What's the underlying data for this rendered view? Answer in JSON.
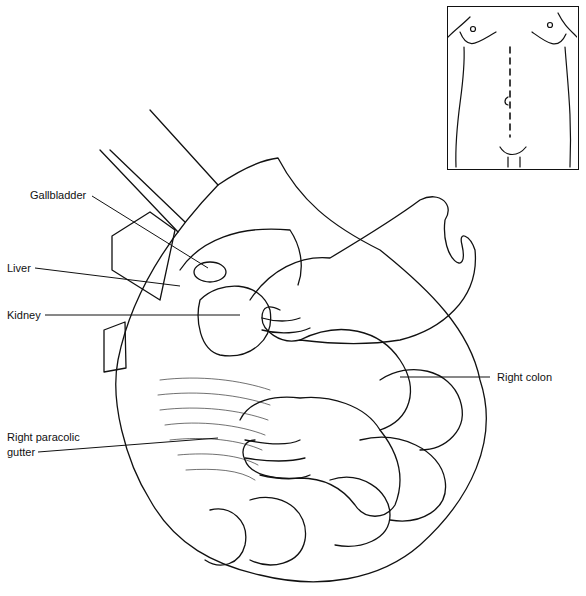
{
  "figure": {
    "labels": [
      {
        "id": "gallbladder",
        "text": "Gallbladder",
        "x": 30,
        "y": 189
      },
      {
        "id": "liver",
        "text": "Liver",
        "x": 7,
        "y": 262
      },
      {
        "id": "kidney",
        "text": "Kidney",
        "x": 7,
        "y": 309
      },
      {
        "id": "right-colon",
        "text": "Right colon",
        "x": 497,
        "y": 371
      },
      {
        "id": "right-paracolic-gutter-1",
        "text": "Right paracolic",
        "x": 7,
        "y": 431
      },
      {
        "id": "right-paracolic-gutter-2",
        "text": "gutter",
        "x": 7,
        "y": 446
      }
    ],
    "leader_lines": [
      {
        "for": "gallbladder",
        "x1": 92,
        "y1": 196,
        "x2": 208,
        "y2": 268
      },
      {
        "for": "liver",
        "x1": 35,
        "y1": 268,
        "x2": 180,
        "y2": 286
      },
      {
        "for": "kidney",
        "x1": 45,
        "y1": 315,
        "x2": 240,
        "y2": 315
      },
      {
        "for": "right-colon",
        "x1": 400,
        "y1": 377,
        "x2": 490,
        "y2": 377
      },
      {
        "for": "right-paracolic-gutter",
        "x1": 38,
        "y1": 452,
        "x2": 218,
        "y2": 438
      }
    ],
    "inset": {
      "description": "Torso outline with vertical dashed midline incision passing beside umbilicus"
    }
  }
}
